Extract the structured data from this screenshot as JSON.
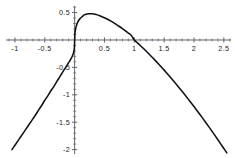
{
  "chart_data": {
    "type": "line",
    "title": "",
    "subtitle": "",
    "xlabel": "",
    "ylabel": "",
    "xlim": [
      -1.15,
      2.62
    ],
    "ylim": [
      -2.08,
      0.62
    ],
    "grid": false,
    "legend": null,
    "legend_position": "none",
    "axes_style": "crossed-at-origin",
    "x_ticks": [
      -1,
      -0.5,
      0.5,
      1,
      1.5,
      2,
      2.5
    ],
    "x_tick_labels": [
      "-1",
      "-0.5",
      "0.5",
      "1",
      "1.5",
      "2",
      "2.5"
    ],
    "y_ticks": [
      0.5,
      -0.5,
      -1,
      -1.5,
      -2
    ],
    "y_tick_labels": [
      "0.5",
      "-0.5",
      "-1",
      "-1.5",
      "-2"
    ],
    "x_minor_tick_step": 0.1,
    "y_minor_tick_step": 0.1,
    "annotations": [],
    "series": [
      {
        "name": "curve",
        "color": "#111114",
        "line_width": 1.55,
        "zero_crossings": [
          0.0,
          1.0
        ],
        "local_maximum": {
          "x": 0.27,
          "y": 0.48
        },
        "x": [
          -1.05,
          -1.0,
          -0.95,
          -0.9,
          -0.85,
          -0.8,
          -0.75,
          -0.7,
          -0.65,
          -0.6,
          -0.55,
          -0.5,
          -0.45,
          -0.4,
          -0.35,
          -0.3,
          -0.26,
          -0.22,
          -0.18,
          -0.15,
          -0.12,
          -0.1,
          -0.08,
          -0.06,
          -0.045,
          -0.03,
          -0.02,
          -0.012,
          -0.006,
          -0.002,
          0.0,
          0.004,
          0.01,
          0.02,
          0.035,
          0.05,
          0.07,
          0.09,
          0.12,
          0.15,
          0.18,
          0.21,
          0.24,
          0.27,
          0.3,
          0.34,
          0.38,
          0.42,
          0.46,
          0.5,
          0.55,
          0.6,
          0.65,
          0.7,
          0.75,
          0.8,
          0.85,
          0.9,
          0.95,
          1.0,
          1.05,
          1.1,
          1.15,
          1.2,
          1.25,
          1.3,
          1.35,
          1.4,
          1.45,
          1.5,
          1.55,
          1.6,
          1.65,
          1.7,
          1.75,
          1.8,
          1.85,
          1.9,
          1.95,
          2.0,
          2.05,
          2.1,
          2.15,
          2.2,
          2.25,
          2.3,
          2.35,
          2.4,
          2.45,
          2.5,
          2.55
        ],
        "y": [
          -2.0,
          -1.92,
          -1.84,
          -1.76,
          -1.68,
          -1.6,
          -1.52,
          -1.44,
          -1.36,
          -1.27,
          -1.19,
          -1.1,
          -1.02,
          -0.93,
          -0.85,
          -0.76,
          -0.69,
          -0.62,
          -0.55,
          -0.5,
          -0.45,
          -0.41,
          -0.38,
          -0.34,
          -0.31,
          -0.27,
          -0.24,
          -0.2,
          -0.16,
          -0.1,
          0.0,
          0.1,
          0.16,
          0.22,
          0.28,
          0.32,
          0.36,
          0.39,
          0.42,
          0.45,
          0.465,
          0.475,
          0.48,
          0.48,
          0.478,
          0.47,
          0.458,
          0.442,
          0.424,
          0.405,
          0.378,
          0.348,
          0.316,
          0.282,
          0.246,
          0.208,
          0.168,
          0.127,
          0.084,
          0.0,
          -0.05,
          -0.1,
          -0.152,
          -0.205,
          -0.26,
          -0.315,
          -0.372,
          -0.43,
          -0.49,
          -0.55,
          -0.612,
          -0.675,
          -0.739,
          -0.804,
          -0.87,
          -0.937,
          -1.005,
          -1.074,
          -1.144,
          -1.215,
          -1.287,
          -1.36,
          -1.434,
          -1.509,
          -1.585,
          -1.662,
          -1.74,
          -1.819,
          -1.899,
          -1.98,
          -2.06
        ]
      }
    ]
  },
  "plot": {
    "background_color": "#ffffff",
    "axis_color": "#55555a",
    "curve_color": "#111114",
    "label_color": "#1a1a1a"
  }
}
